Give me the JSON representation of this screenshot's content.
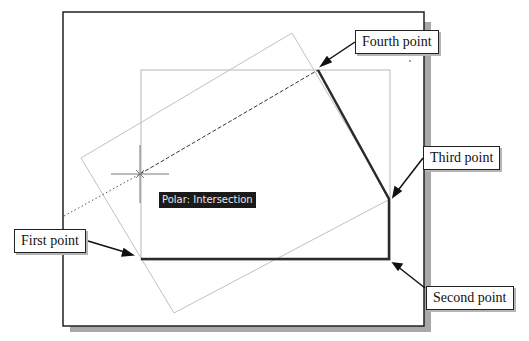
{
  "callouts": {
    "fourth": "Fourth point",
    "third": "Third point",
    "first": "First point",
    "second": "Second point"
  },
  "tooltip": "Polar: Intersection",
  "colors": {
    "frame": "#222222",
    "shadow": "#a8a8a8",
    "guide": "#b8b8b8",
    "polyline": "#2a2a2a",
    "tooltip_bg": "#1a1a1a"
  }
}
